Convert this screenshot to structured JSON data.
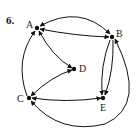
{
  "problem": {
    "number": "6."
  },
  "diagram": {
    "type": "directed-graph",
    "stroke_color": "#111111",
    "nodes": [
      {
        "id": "A",
        "label": "A",
        "x": 37,
        "y": 28,
        "label_x": 26,
        "label_y": 20
      },
      {
        "id": "B",
        "label": "B",
        "x": 112,
        "y": 37,
        "label_x": 116,
        "label_y": 29
      },
      {
        "id": "C",
        "label": "C",
        "x": 29,
        "y": 98,
        "label_x": 17,
        "label_y": 94
      },
      {
        "id": "D",
        "label": "D",
        "x": 74,
        "y": 69,
        "label_x": 79,
        "label_y": 64
      },
      {
        "id": "E",
        "label": "E",
        "x": 103,
        "y": 98,
        "label_x": 100,
        "label_y": 103
      }
    ],
    "edges": [
      {
        "id": "AB-top",
        "from": "A",
        "to": "B",
        "directed": "both",
        "path": "M 40 26 Q 80 4 110 34"
      },
      {
        "id": "AB-straight",
        "from": "A",
        "to": "B",
        "directed": "both",
        "path": "M 40 29 Q 76 36 109 37"
      },
      {
        "id": "AD",
        "from": "A",
        "to": "D",
        "directed": "both",
        "path": "M 39 31 Q 52 56 72 68"
      },
      {
        "id": "CD",
        "from": "C",
        "to": "D",
        "directed": "both",
        "path": "M 31 96 Q 52 76 72 70"
      },
      {
        "id": "CE",
        "from": "C",
        "to": "E",
        "directed": "both",
        "path": "M 32 98 Q 66 103 101 98"
      },
      {
        "id": "CA-left",
        "from": "C",
        "to": "A",
        "directed": "to",
        "path": "M 27 96 Q 14 60 35 31"
      },
      {
        "id": "BE-left",
        "from": "B",
        "to": "E",
        "directed": "to",
        "path": "M 110 40 Q 100 66 102 95"
      },
      {
        "id": "BE-right",
        "from": "B",
        "to": "E",
        "directed": "to",
        "path": "M 113 40 Q 114 70 105 95"
      },
      {
        "id": "BC-outer",
        "from": "B",
        "to": "C",
        "directed": "both",
        "path": "M 115 39 Q 148 105 105 124 Q 60 135 31 101"
      }
    ]
  }
}
